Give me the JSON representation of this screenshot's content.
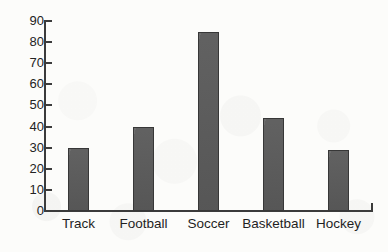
{
  "chart_data": {
    "type": "bar",
    "title": "",
    "subtitle": "",
    "xlabel": "",
    "ylabel": "",
    "categories": [
      "Track",
      "Football",
      "Soccer",
      "Basketball",
      "Hockey"
    ],
    "values": [
      30,
      40,
      85,
      44,
      29
    ],
    "ylim": [
      0,
      90
    ],
    "yticks": [
      0,
      10,
      20,
      30,
      40,
      50,
      60,
      70,
      80,
      90
    ],
    "ytick_labels": [
      "0",
      "10",
      "20",
      "30",
      "40",
      "50",
      "60",
      "70",
      "80",
      "90"
    ],
    "grid": false,
    "legend": null,
    "annotations": [],
    "colors": {
      "bar_fill": "#5b5b5b",
      "bar_outline": "#373737",
      "axis": "#3b3b3b",
      "text": "#1f1f1f",
      "background": "#fcfcfa"
    }
  }
}
